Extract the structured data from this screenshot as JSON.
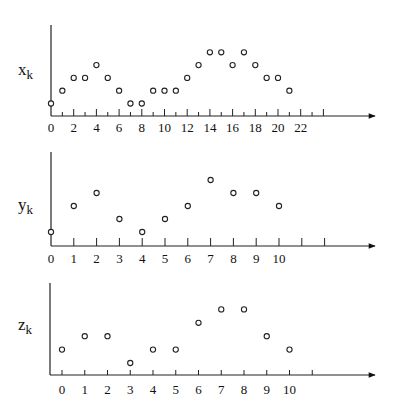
{
  "chart_data": [
    {
      "type": "scatter",
      "title": "",
      "ylabel": "x_k",
      "xlabel": "",
      "x": [
        0,
        1,
        2,
        3,
        4,
        5,
        6,
        7,
        8,
        9,
        10,
        11,
        12,
        13,
        14,
        15,
        16,
        17,
        18,
        19,
        20,
        21
      ],
      "values": [
        1,
        2,
        3,
        3,
        4,
        3,
        2,
        1,
        1,
        2,
        2,
        2,
        3,
        4,
        5,
        5,
        4,
        5,
        4,
        3,
        3,
        2
      ],
      "tick_labels": [
        "0",
        "2",
        "4",
        "6",
        "8",
        "10",
        "12",
        "14",
        "16",
        "18",
        "20",
        "22"
      ],
      "xlim": [
        0,
        24
      ],
      "grid": false,
      "marker": "open-circle"
    },
    {
      "type": "scatter",
      "title": "",
      "ylabel": "y_k",
      "xlabel": "",
      "x": [
        0,
        1,
        2,
        3,
        4,
        5,
        6,
        7,
        8,
        9,
        10
      ],
      "values": [
        1,
        3,
        4,
        2,
        1,
        2,
        3,
        5,
        4,
        4,
        3
      ],
      "tick_labels": [
        "0",
        "1",
        "2",
        "3",
        "4",
        "5",
        "6",
        "7",
        "8",
        "9",
        "10"
      ],
      "xlim": [
        0,
        12
      ],
      "grid": false,
      "marker": "open-circle"
    },
    {
      "type": "scatter",
      "title": "",
      "ylabel": "z_k",
      "xlabel": "",
      "x": [
        0,
        1,
        2,
        3,
        4,
        5,
        6,
        7,
        8,
        9,
        10
      ],
      "values": [
        2,
        3,
        3,
        1,
        2,
        2,
        4,
        5,
        5,
        3,
        2
      ],
      "tick_labels": [
        "0",
        "1",
        "2",
        "3",
        "4",
        "5",
        "6",
        "7",
        "8",
        "9",
        "10"
      ],
      "xlim": [
        0,
        11
      ],
      "grid": false,
      "marker": "open-circle"
    }
  ],
  "labels": {
    "x_main": "x",
    "y_main": "y",
    "z_main": "z",
    "sub": "k"
  }
}
